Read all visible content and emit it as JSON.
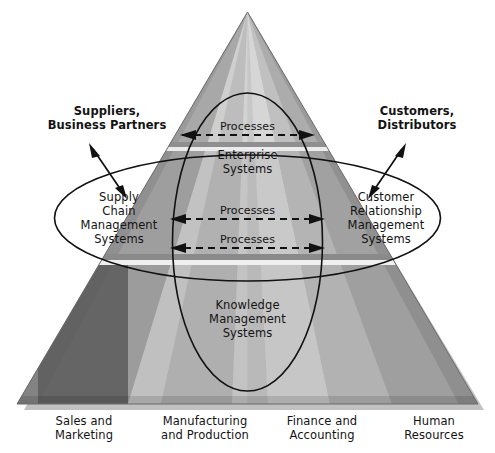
{
  "diagram": {
    "external_actors": {
      "left": "Suppliers,\nBusiness Partners",
      "left_line1": "Suppliers,",
      "left_line2": "Business Partners",
      "right_line1": "Customers,",
      "right_line2": "Distributors"
    },
    "systems": {
      "enterprise_line1": "Enterprise",
      "enterprise_line2": "Systems",
      "scm_line1": "Supply",
      "scm_line2": "Chain",
      "scm_line3": "Management",
      "scm_line4": "Systems",
      "crm_line1": "Customer",
      "crm_line2": "Relationship",
      "crm_line3": "Management",
      "crm_line4": "Systems",
      "kms_line1": "Knowledge",
      "kms_line2": "Management",
      "kms_line3": "Systems"
    },
    "process_labels": {
      "top": "Processes",
      "middle": "Processes",
      "lower": "Processes"
    },
    "functional_areas": [
      {
        "line1": "Sales and",
        "line2": "Marketing"
      },
      {
        "line1": "Manufacturing",
        "line2": "and Production"
      },
      {
        "line1": "Finance and",
        "line2": "Accounting"
      },
      {
        "line1": "Human",
        "line2": "Resources"
      }
    ],
    "colors": {
      "background": "#ffffff",
      "text": "#131313",
      "outline": "#111111",
      "pyramid_lightest": "#e3e3e3",
      "pyramid_light": "#c9c9c9",
      "pyramid_mid": "#b4b4b4",
      "pyramid_mid_dark": "#a0a0a0",
      "pyramid_dark": "#8b8b8b",
      "pyramid_darkest": "#6e6e6e",
      "band_divider": "#9a9a9a",
      "band_highlight": "#f0f0f0"
    }
  }
}
